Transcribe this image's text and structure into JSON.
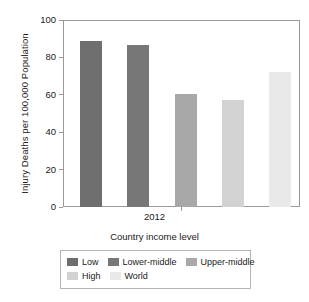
{
  "chart_data": {
    "type": "bar",
    "title": "",
    "xlabel": "Country income level",
    "ylabel": "Injury Deaths per 100,000 Population",
    "categories": [
      "Low",
      "Lower-middle",
      "Upper-middle",
      "High",
      "World"
    ],
    "values": [
      89,
      86.5,
      60.5,
      57,
      72
    ],
    "x_tick_labels": [
      "2012"
    ],
    "group_label": "2012",
    "ylim": [
      0,
      100
    ],
    "y_ticks": [
      0,
      20,
      40,
      60,
      80,
      100
    ],
    "y_tick_labels": [
      "0",
      "20",
      "40",
      "60",
      "80",
      "100"
    ],
    "grid": false,
    "legend_position": "bottom",
    "series": [
      {
        "name": "Low",
        "value": 89,
        "color": "#6e6e6e"
      },
      {
        "name": "Lower-middle",
        "value": 86.5,
        "color": "#777777"
      },
      {
        "name": "Upper-middle",
        "value": 60.5,
        "color": "#a8a8a8"
      },
      {
        "name": "High",
        "value": 57,
        "color": "#d2d2d2"
      },
      {
        "name": "World",
        "value": 72,
        "color": "#e9e9e9"
      }
    ]
  },
  "legend": {
    "rows": [
      [
        {
          "label": "Low",
          "color": "#6e6e6e"
        },
        {
          "label": "Lower-middle",
          "color": "#777777"
        },
        {
          "label": "Upper-middle",
          "color": "#a8a8a8"
        }
      ],
      [
        {
          "label": "High",
          "color": "#d2d2d2"
        },
        {
          "label": "World",
          "color": "#e9e9e9"
        }
      ]
    ]
  },
  "colors": {
    "axis": "#9a9a9a",
    "text": "#1a1a1a",
    "background": "#ffffff",
    "legend_border": "#b4b4b4"
  }
}
